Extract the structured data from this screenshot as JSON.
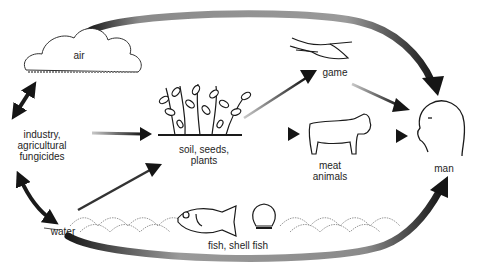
{
  "diagram": {
    "nodes": {
      "air": {
        "label": "air"
      },
      "industry": {
        "label": "industry,\nagricultural\nfungicides"
      },
      "soil": {
        "label": "soil, seeds,\nplants"
      },
      "game": {
        "label": "game"
      },
      "meat": {
        "label": "meat\nanimals"
      },
      "man": {
        "label": "man"
      },
      "water": {
        "label": "water"
      },
      "fish": {
        "label": "fish, shell fish"
      }
    },
    "edges": [
      {
        "from": "industry",
        "to": "air",
        "type": "bidirectional"
      },
      {
        "from": "industry",
        "to": "water",
        "type": "bidirectional"
      },
      {
        "from": "industry",
        "to": "soil",
        "type": "directed"
      },
      {
        "from": "water",
        "to": "soil",
        "type": "directed"
      },
      {
        "from": "soil",
        "to": "game",
        "type": "directed"
      },
      {
        "from": "soil",
        "to": "meat",
        "type": "directed"
      },
      {
        "from": "game",
        "to": "man",
        "type": "directed"
      },
      {
        "from": "meat",
        "to": "man",
        "type": "directed"
      },
      {
        "from": "air",
        "to": "man",
        "type": "directed"
      },
      {
        "from": "water",
        "to": "man",
        "type": "directed",
        "via": "fish"
      }
    ],
    "colors": {
      "ink": "#1a1a1a",
      "stipple": "#9a9a9a",
      "background": "#ffffff"
    }
  }
}
